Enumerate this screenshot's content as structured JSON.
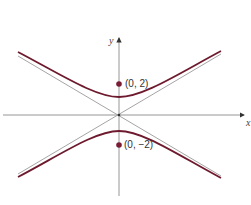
{
  "figure": {
    "type": "hyperbola",
    "axes": {
      "x_label": "x",
      "y_label": "y"
    },
    "colors": {
      "curve": "#6e1a2e",
      "point": "#7a1c34",
      "axis": "#8a8a8a",
      "asymptote": "#9a9a9a"
    },
    "points": [
      {
        "label": "(0, 2)",
        "x": 0,
        "y": 2
      },
      {
        "label": "(0, −2)",
        "x": 0,
        "y": -2
      }
    ]
  }
}
